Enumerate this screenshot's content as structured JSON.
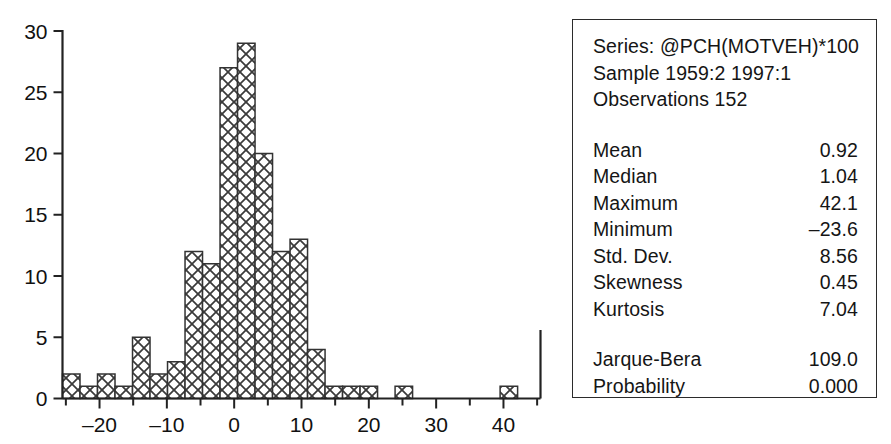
{
  "window": {
    "title": "Histogram and Descriptive Statistics"
  },
  "stats_panel": {
    "series_line": "Series: @PCH(MOTVEH)*100",
    "sample_line": "Sample 1959:2 1997:1",
    "observations_line": "Observations 152",
    "rows": [
      {
        "label": "Mean",
        "value": "0.92"
      },
      {
        "label": "Median",
        "value": "1.04"
      },
      {
        "label": "Maximum",
        "value": "42.1"
      },
      {
        "label": "Minimum",
        "value": "–23.6"
      },
      {
        "label": "Std. Dev.",
        "value": "8.56"
      },
      {
        "label": "Skewness",
        "value": "0.45"
      },
      {
        "label": "Kurtosis",
        "value": "7.04"
      }
    ],
    "test_rows": [
      {
        "label": "Jarque-Bera",
        "value": "109.0"
      },
      {
        "label": "Probability",
        "value": "0.000"
      }
    ],
    "border_color": "#2b2b2b"
  },
  "chart_data": {
    "type": "bar",
    "title": "",
    "subtitle": "",
    "xlabel": "",
    "ylabel": "",
    "grid": false,
    "legend": "none",
    "xlim": [
      -25.5,
      45.5
    ],
    "ylim": [
      0,
      30
    ],
    "xticks": [
      -20,
      -10,
      0,
      10,
      20,
      30,
      40
    ],
    "xtick_labels": [
      "–20",
      "–10",
      "0",
      "10",
      "20",
      "30",
      "40"
    ],
    "xminorticks": [
      -25,
      -20,
      -15,
      -10,
      -5,
      0,
      5,
      10,
      15,
      20,
      25,
      30,
      35,
      40,
      45
    ],
    "yticks": [
      0,
      5,
      10,
      15,
      20,
      25,
      30
    ],
    "ytick_labels": [
      "0",
      "5",
      "10",
      "15",
      "20",
      "25",
      "30"
    ],
    "bin_width": 2.6,
    "bin_edges": [
      -25.5,
      -22.9,
      -20.3,
      -17.7,
      -15.1,
      -12.5,
      -9.9,
      -7.3,
      -4.7,
      -2.1,
      0.5,
      3.1,
      5.7,
      8.3,
      10.9,
      13.5,
      16.1,
      18.7,
      21.3,
      23.9,
      26.5,
      29.1,
      31.7,
      34.3,
      36.9,
      39.5,
      42.1,
      45.5
    ],
    "bin_centers": [
      -24.2,
      -21.6,
      -19.0,
      -16.4,
      -13.8,
      -11.2,
      -8.6,
      -6.0,
      -3.4,
      -0.8,
      1.8,
      4.4,
      7.0,
      9.6,
      12.2,
      14.8,
      17.4,
      20.0,
      22.6,
      25.2,
      27.8,
      30.4,
      33.0,
      35.6,
      38.2,
      40.8,
      43.4
    ],
    "values": [
      2,
      1,
      2,
      1,
      5,
      2,
      3,
      12,
      11,
      27,
      29,
      20,
      12,
      13,
      4,
      1,
      1,
      1,
      0,
      1,
      0,
      0,
      0,
      0,
      0,
      1,
      0
    ],
    "bar_facecolor": "#ffffff",
    "bar_edgecolor": "#333333",
    "bar_hatch": "crosshatch",
    "axis_color": "#222222",
    "total_observations": 152
  }
}
